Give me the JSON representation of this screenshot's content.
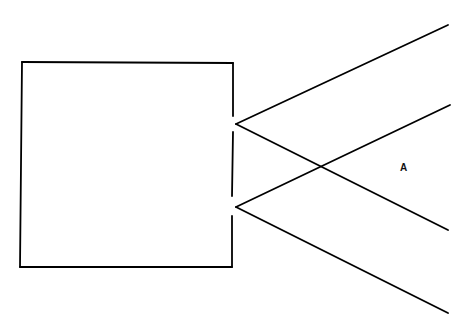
{
  "diagram": {
    "label_a": "A",
    "stroke_color": "#000000",
    "background_color": "#ffffff",
    "rectangle": {
      "x": 22,
      "y": 62,
      "width": 210,
      "height": 205,
      "right_edge_gaps": [
        124,
        207
      ]
    },
    "vertices": [
      {
        "name": "upper",
        "x": 236,
        "y": 124
      },
      {
        "name": "lower",
        "x": 236,
        "y": 207
      }
    ],
    "lines": [
      {
        "from": [
          236,
          124
        ],
        "to": [
          448,
          25
        ]
      },
      {
        "from": [
          236,
          124
        ],
        "to": [
          448,
          230
        ]
      },
      {
        "from": [
          236,
          207
        ],
        "to": [
          450,
          105
        ]
      },
      {
        "from": [
          236,
          207
        ],
        "to": [
          448,
          313
        ]
      }
    ],
    "label_position": {
      "x": 400,
      "y": 171
    }
  }
}
